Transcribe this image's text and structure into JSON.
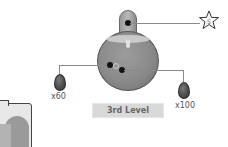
{
  "flask": {
    "name": "potion-flask",
    "color": "#8c8c8c"
  },
  "callouts": {
    "left_item": {
      "quantity": "x60",
      "icon": "egg-icon"
    },
    "right_item": {
      "quantity": "x100",
      "icon": "egg-icon"
    },
    "top_item": {
      "icon": "star-icon",
      "glyph": "S"
    }
  },
  "level": {
    "label": "3rd Level"
  },
  "corner_item": {
    "icon": "container-icon"
  }
}
